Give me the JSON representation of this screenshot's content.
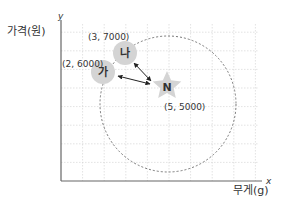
{
  "axes": {
    "y_var": "y",
    "y_label": "가격(원)",
    "x_var": "x",
    "x_label": "무게(g)"
  },
  "points": [
    {
      "id": "ga",
      "label": "가",
      "x": 2,
      "y": 6000,
      "coord_text": "(2, 6000)"
    },
    {
      "id": "na",
      "label": "나",
      "x": 3,
      "y": 7000,
      "coord_text": "(3, 7000)"
    },
    {
      "id": "n",
      "label": "N",
      "x": 5,
      "y": 5000,
      "coord_text": "(5, 5000)",
      "shape": "star"
    }
  ],
  "colors": {
    "grid": "#cfcfcf",
    "axis": "#555555",
    "marker": "#d4d4d4",
    "circle": "#777777",
    "arrow": "#222222"
  }
}
